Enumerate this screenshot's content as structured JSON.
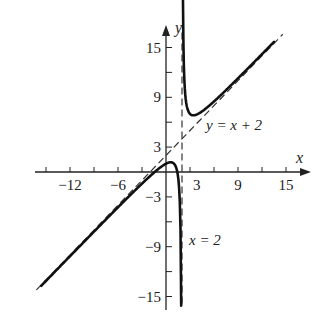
{
  "chart_data": {
    "type": "line",
    "title": "",
    "xlabel": "x",
    "ylabel": "y",
    "xlim": [
      -15,
      18
    ],
    "ylim": [
      -16,
      17
    ],
    "grid": false,
    "x_ticks": [
      -15,
      -12,
      -9,
      -6,
      -3,
      3,
      6,
      9,
      12,
      15
    ],
    "x_tick_labels": [
      {
        "value": -12,
        "label": "−12"
      },
      {
        "value": -6,
        "label": "−6"
      },
      {
        "value": 3,
        "label": "3"
      },
      {
        "value": 9,
        "label": "9"
      },
      {
        "value": 15,
        "label": "15"
      }
    ],
    "y_ticks": [
      -15,
      -12,
      -9,
      -6,
      -3,
      3,
      6,
      9,
      12,
      15
    ],
    "y_tick_labels": [
      {
        "value": 15,
        "label": "15"
      },
      {
        "value": 9,
        "label": "9"
      },
      {
        "value": 3,
        "label": "3"
      },
      {
        "value": -3,
        "label": "−3"
      },
      {
        "value": -9,
        "label": "−9"
      },
      {
        "value": -15,
        "label": "−15"
      }
    ],
    "series": [
      {
        "name": "f(x) = x + 2 + 2/(x − 2)",
        "style": "solid",
        "branches": [
          {
            "x": [
              -15.6,
              -12,
              -9,
              -6,
              -3,
              -1.4,
              0,
              0.59,
              1.2,
              1.6,
              1.8,
              1.9
            ],
            "y": [
              -13.7,
              -10.1,
              -7.2,
              -4.3,
              -1.4,
              -0.2,
              1.0,
              1.17,
              0.7,
              -1.4,
              -6.2,
              -16.1
            ]
          },
          {
            "x": [
              2.12,
              2.3,
              2.7,
              3.41,
              4.5,
              6,
              9,
              12,
              13.5
            ],
            "y": [
              17.0,
              10.97,
              7.56,
              6.83,
              7.3,
              8.5,
              11.29,
              14.2,
              15.67
            ]
          }
        ]
      },
      {
        "name": "Slant asymptote",
        "style": "dashed",
        "x": [
          -16.2,
          14.6
        ],
        "y": [
          -14.2,
          16.6
        ]
      },
      {
        "name": "Vertical asymptote",
        "style": "dashed",
        "x": [
          2,
          2
        ],
        "y": [
          16.8,
          -16.3
        ]
      }
    ],
    "annotations": [
      {
        "text": "y = x + 2",
        "x": 5,
        "y": 5.5
      },
      {
        "text": "x = 2",
        "x": 2.6,
        "y": -9
      }
    ]
  },
  "labels": {
    "x_axis": "x",
    "y_axis": "y",
    "slant_asymptote": "y = x + 2",
    "vertical_asymptote": "x = 2"
  }
}
